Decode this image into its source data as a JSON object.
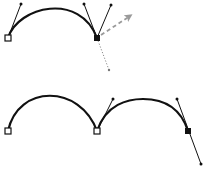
{
  "diagram": {
    "colors": {
      "stroke": "#111111",
      "anchor_fill_open": "#ffffff",
      "anchor_fill_selected": "#111111",
      "arrow": "#9a9a9a",
      "dotted": "#8a8a8a",
      "background": "#ffffff"
    },
    "top": {
      "anchors": [
        {
          "x": 8,
          "y": 38,
          "type": "open"
        },
        {
          "x": 97,
          "y": 38,
          "type": "selected"
        }
      ],
      "handles": [
        {
          "from": [
            8,
            38
          ],
          "to": [
            21,
            4
          ]
        },
        {
          "from": [
            97,
            38
          ],
          "to": [
            84,
            4
          ]
        },
        {
          "from": [
            97,
            38
          ],
          "to": [
            111,
            5
          ]
        }
      ],
      "drag_arrow": {
        "from": [
          100,
          36
        ],
        "to": [
          132,
          14
        ]
      },
      "dotted_line": {
        "from": [
          97,
          38
        ],
        "to": [
          109,
          70
        ]
      }
    },
    "bottom": {
      "anchors": [
        {
          "x": 8,
          "y": 131,
          "type": "open"
        },
        {
          "x": 97,
          "y": 131,
          "type": "open"
        },
        {
          "x": 188,
          "y": 131,
          "type": "selected"
        }
      ],
      "handles": [
        {
          "from": [
            97,
            131
          ],
          "to": [
            113,
            99
          ]
        },
        {
          "from": [
            177,
            99
          ],
          "to": [
            201,
            164
          ]
        }
      ]
    }
  }
}
